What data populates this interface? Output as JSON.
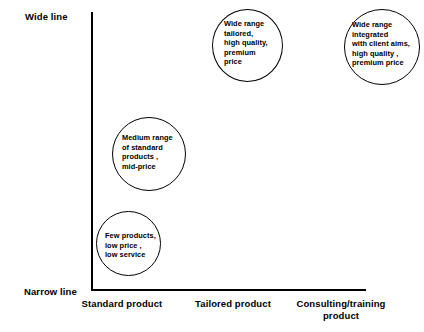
{
  "chart_data": {
    "type": "scatter",
    "title": "",
    "xlabel": "",
    "ylabel": "",
    "grid": false,
    "legend": "none",
    "y_axis": {
      "top_label": "Wide line",
      "bottom_label": "Narrow line"
    },
    "x_axis": {
      "categories": [
        "Standard\nproduct",
        "Tailored\nproduct",
        "Consulting/training\nproduct"
      ]
    },
    "bubbles": [
      {
        "id": "few-products",
        "x_category": "Standard product",
        "y_level": "low",
        "text": "Few products,\nlow price ,\nlow service"
      },
      {
        "id": "medium-range",
        "x_category": "Standard product",
        "y_level": "medium",
        "text": "Medium range\nof standard\nproducts ,\nmid-price"
      },
      {
        "id": "wide-range-tailored",
        "x_category": "Tailored product",
        "y_level": "high",
        "text": "Wide range\ntailored,\nhigh quality,\npremium\nprice"
      },
      {
        "id": "wide-range-integrated",
        "x_category": "Consulting/training product",
        "y_level": "high",
        "text": "Wide range\nintegrated\nwith client aims,\nhigh quality ,\npremium price"
      }
    ]
  },
  "axis": {
    "wide_line_label": "Wide line",
    "narrow_line_label": "Narrow line"
  },
  "x_labels": {
    "standard": "Standard\nproduct",
    "tailored": "Tailored\nproduct",
    "consulting": "Consulting/training\nproduct"
  },
  "bubble_text": {
    "few_products": "Few products,\nlow price ,\nlow service",
    "medium_range": "Medium range\nof standard\nproducts ,\nmid-price",
    "wide_tailored": "Wide range\ntailored,\nhigh quality,\npremium\nprice",
    "wide_integrated": "Wide range\nintegrated\nwith client aims,\nhigh quality ,\npremium price"
  },
  "colors": {
    "stroke": "#000000",
    "background": "#ffffff"
  }
}
